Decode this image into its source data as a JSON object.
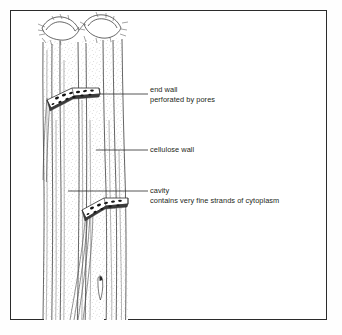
{
  "figure": {
    "kind": "biology-line-drawing",
    "border_color": "#2b2b2b",
    "ink_color": "#3a3a3a",
    "text_color": "#231f20",
    "stipple_color": "#9a9a9a",
    "pore_color": "#1a1a1a"
  },
  "labels": [
    {
      "id": "end-wall",
      "line1": "end wall",
      "line2": "perforated by pores",
      "leader": {
        "x1": 100,
        "y1": 94,
        "x2": 148,
        "y2": 94
      }
    },
    {
      "id": "cellulose-wall",
      "line1": "cellulose wall",
      "line2": "",
      "leader": {
        "x1": 96,
        "y1": 150,
        "x2": 148,
        "y2": 150
      }
    },
    {
      "id": "cavity",
      "line1": "cavity",
      "line2": "contains very fine strands of cytoplasm",
      "leader": {
        "x1": 68,
        "y1": 191,
        "x2": 148,
        "y2": 191
      }
    }
  ],
  "structures": {
    "sieve_plate_upper": "angled perforated end wall with pores",
    "sieve_plate_lower": "angled perforated end wall with pores and cytoplasm strands",
    "top_opening": "torn cut-away showing two tube mouths"
  }
}
